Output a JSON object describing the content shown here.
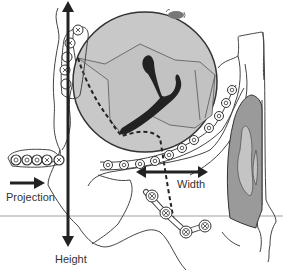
{
  "diagram": {
    "type": "anatomical cross-section diagram",
    "labels": {
      "height": "Height",
      "width": "Width",
      "projection": "Projection"
    },
    "arrows": [
      {
        "name": "height",
        "direction": "vertical-bidirectional"
      },
      {
        "name": "width",
        "direction": "horizontal-bidirectional"
      },
      {
        "name": "projection",
        "direction": "right"
      }
    ],
    "colors": {
      "outline": "#333333",
      "region_fill": "#c8c8c8",
      "dark_structure": "#222222",
      "tissue_mid": "#9a9a9a",
      "tissue_light": "#bfbfbf",
      "reference_line": "#c8c8c8",
      "arrow": "#222222"
    }
  }
}
